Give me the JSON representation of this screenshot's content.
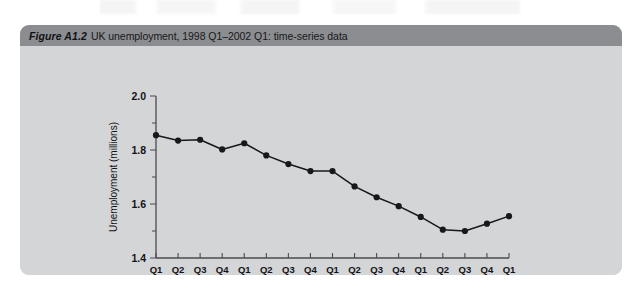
{
  "figure": {
    "label": "Figure A1.2",
    "caption": "UK unemployment, 1998 Q1–2002 Q1: time-series data",
    "header_bg": "#8c8d90",
    "card_bg": "#d4d5d7",
    "ink": "#17181c"
  },
  "chart_data": {
    "type": "line",
    "title": "UK unemployment, 1998 Q1–2002 Q1: time-series data",
    "xlabel": "",
    "ylabel": "Unemployment (millions)",
    "ylim": [
      1.4,
      2.0
    ],
    "yticks": [
      "1.4",
      "1.6",
      "1.8",
      "2.0"
    ],
    "ytick_values": [
      1.4,
      1.6,
      1.8,
      2.0
    ],
    "minor_yticks": [
      1.5,
      1.7,
      1.9
    ],
    "grid": false,
    "legend": false,
    "marker": "filled-circle",
    "series_color": "#17181c",
    "categories": [
      "Q1",
      "Q2",
      "Q3",
      "Q4",
      "Q1",
      "Q2",
      "Q3",
      "Q4",
      "Q1",
      "Q2",
      "Q3",
      "Q4",
      "Q1",
      "Q2",
      "Q3",
      "Q4",
      "Q1"
    ],
    "year_groups": [
      {
        "year": "1998",
        "start": 0,
        "end": 3
      },
      {
        "year": "1999",
        "start": 4,
        "end": 7
      },
      {
        "year": "2000",
        "start": 8,
        "end": 11
      },
      {
        "year": "2001",
        "start": 12,
        "end": 15
      },
      {
        "year": "2002",
        "start": 16,
        "end": 16
      }
    ],
    "x_full_labels": [
      "1998 Q1",
      "1998 Q2",
      "1998 Q3",
      "1998 Q4",
      "1999 Q1",
      "1999 Q2",
      "1999 Q3",
      "1999 Q4",
      "2000 Q1",
      "2000 Q2",
      "2000 Q3",
      "2000 Q4",
      "2001 Q1",
      "2001 Q2",
      "2001 Q3",
      "2001 Q4",
      "2002 Q1"
    ],
    "values": [
      1.855,
      1.835,
      1.838,
      1.802,
      1.825,
      1.78,
      1.748,
      1.722,
      1.722,
      1.665,
      1.625,
      1.592,
      1.552,
      1.505,
      1.5,
      1.527,
      1.555
    ]
  },
  "axis_values_display": {
    "y_min": "1.4",
    "y_max": "2.0"
  }
}
